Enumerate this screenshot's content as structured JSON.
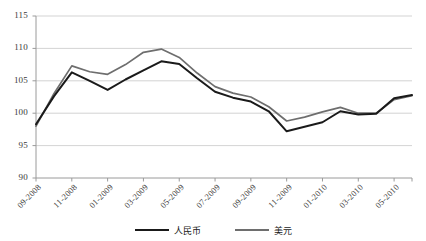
{
  "chart_data": {
    "type": "line",
    "title": "",
    "xlabel": "",
    "ylabel": "",
    "ylim": [
      90,
      115
    ],
    "yticks": [
      90,
      95,
      100,
      105,
      110,
      115
    ],
    "grid": true,
    "legend_position": "bottom",
    "x": [
      "09-2008",
      "10-2008",
      "11-2008",
      "12-2008",
      "01-2009",
      "02-2009",
      "03-2009",
      "04-2009",
      "05-2009",
      "06-2009",
      "07-2009",
      "08-2009",
      "09-2009",
      "10-2009",
      "11-2009",
      "12-2009",
      "01-2010",
      "02-2010",
      "03-2010",
      "04-2010",
      "05-2010",
      "06-2010"
    ],
    "xtick_labels": [
      "09-2008",
      "11-2008",
      "01-2009",
      "03-2009",
      "05-2009",
      "07-2009",
      "09-2009",
      "11-2009",
      "01-2010",
      "03-2010",
      "05-2010"
    ],
    "xtick_indices": [
      0,
      2,
      4,
      6,
      8,
      10,
      12,
      14,
      16,
      18,
      20
    ],
    "series": [
      {
        "name": "人民币",
        "color": "#1a1a1a",
        "values": [
          98.3,
          102.6,
          106.3,
          105.0,
          103.6,
          105.2,
          106.6,
          108.0,
          107.6,
          105.4,
          103.3,
          102.4,
          101.8,
          100.3,
          97.2,
          97.9,
          98.6,
          100.3,
          99.8,
          99.9,
          102.3,
          102.8
        ]
      },
      {
        "name": "美元",
        "color": "#6e6e6e",
        "values": [
          98.0,
          103.0,
          107.3,
          106.4,
          106.0,
          107.5,
          109.4,
          109.9,
          108.6,
          106.2,
          104.1,
          103.1,
          102.5,
          101.0,
          98.8,
          99.4,
          100.2,
          100.9,
          100.0,
          100.0,
          102.1,
          102.7
        ]
      }
    ]
  },
  "legend": {
    "items": [
      {
        "label": "人民币",
        "color": "#1a1a1a"
      },
      {
        "label": "美元",
        "color": "#6e6e6e"
      }
    ]
  },
  "colors": {
    "grid": "#c8c8c8",
    "axis": "#9a9a9a",
    "text": "#3a3a3a",
    "series_rmb": "#1a1a1a",
    "series_usd": "#6e6e6e",
    "background": "#ffffff"
  }
}
